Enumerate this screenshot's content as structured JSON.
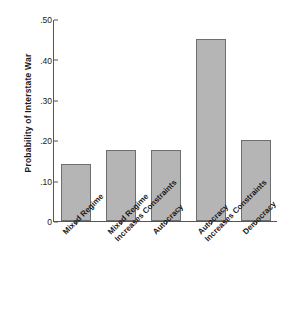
{
  "figure": {
    "clipped_caption": "Chief Executive",
    "ylabel": "Probability of Interstate War"
  },
  "chart_data": {
    "type": "bar",
    "title": "",
    "xlabel": "",
    "ylabel": "Probability of Interstate War",
    "ylim": [
      0,
      0.5
    ],
    "grid": false,
    "legend": "none",
    "ytick_labels": [
      ".50",
      ".40",
      ".30",
      ".20",
      ".10",
      "0"
    ],
    "ytick_values": [
      0.5,
      0.4,
      0.3,
      0.2,
      0.1,
      0
    ],
    "categories": [
      "Mixed Regime",
      "Mixed Regime Increases Constraints",
      "Autocracy",
      "Autocracy Increases Constraints",
      "Democracy"
    ],
    "category_lines": [
      [
        "Mixed Regime",
        ""
      ],
      [
        "Mixed Regime",
        "Increases Constraints"
      ],
      [
        "Autocracy",
        ""
      ],
      [
        "Autocracy",
        "Increases Constraints"
      ],
      [
        "Democracy",
        ""
      ]
    ],
    "values": [
      0.14,
      0.175,
      0.175,
      0.45,
      0.2
    ],
    "bar_color": "#b5b5b5",
    "bar_edge_color": "#6e6e6e"
  }
}
